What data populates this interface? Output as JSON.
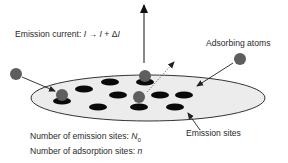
{
  "figure": {
    "labels": {
      "emission_current_prefix": "Emission current: ",
      "emission_current_I": "I",
      "emission_current_arrow": " → ",
      "emission_current_I2": "I",
      "emission_current_plus": " + Δ",
      "emission_current_dI": "I",
      "adsorbing_atoms": "Adsorbing atoms",
      "emission_sites": "Emission sites",
      "num_emission_sites_prefix": "Number of emission sites: ",
      "num_emission_sites_symbol": "N",
      "num_emission_sites_sub": "0",
      "num_adsorption_sites_prefix": "Number of adsorption sites: ",
      "num_adsorption_sites_symbol": "n"
    },
    "colors": {
      "surface_fill": "#ececec",
      "surface_stroke": "#333333",
      "site_fill": "#0a0a0a",
      "atom_fill": "#5e5e5e",
      "arrow_stroke": "#222222",
      "text": "#2a2a2a"
    }
  }
}
